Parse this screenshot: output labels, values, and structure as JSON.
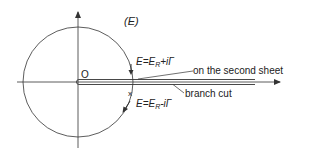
{
  "diagram": {
    "type": "complex-energy-plane",
    "plane_label": "(E)",
    "origin_label": "O",
    "upper_point": {
      "prefix": "E=E",
      "subscript": "R",
      "suffix": "+iΓ",
      "note": "on the second sheet"
    },
    "lower_point": {
      "marker": "x",
      "prefix": "E=E",
      "subscript": "R",
      "suffix": "-iΓ"
    },
    "branch_cut_label": "branch cut",
    "colors": {
      "stroke": "#333333",
      "background": "#ffffff"
    }
  }
}
